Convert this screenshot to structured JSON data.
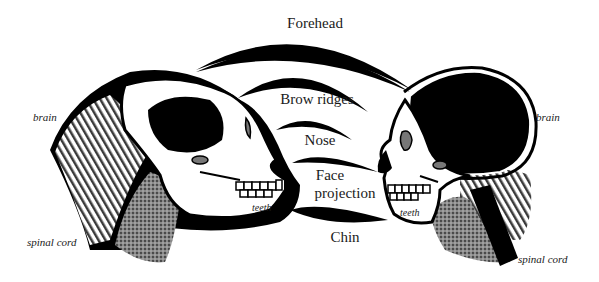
{
  "diagram": {
    "colors": {
      "ink": "#000000",
      "paper": "#ffffff",
      "shade": "#6b6b6b",
      "text": "#1a1a1a"
    },
    "comparison_labels": [
      {
        "id": "forehead",
        "text": "Forehead"
      },
      {
        "id": "brow_ridges",
        "text": "Brow ridges"
      },
      {
        "id": "nose",
        "text": "Nose"
      },
      {
        "id": "face_projection",
        "text": "Face projection",
        "lines": [
          "Face",
          "projection"
        ]
      },
      {
        "id": "chin",
        "text": "Chin"
      }
    ],
    "left_figure": {
      "name": "ape skull",
      "labels": {
        "brain": "brain",
        "spinal_cord": "spinal cord",
        "teeth": "teeth"
      }
    },
    "right_figure": {
      "name": "human skull",
      "labels": {
        "brain": "brain",
        "spinal_cord": "spinal cord",
        "teeth": "teeth"
      }
    }
  }
}
